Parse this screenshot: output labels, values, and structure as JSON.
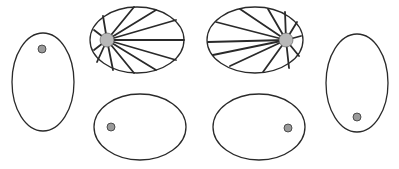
{
  "diagram": {
    "colors": {
      "stroke": "#2a2a2a",
      "hub": "#b8b8b8",
      "dot": "#9a9a9a",
      "background": "#ffffff"
    },
    "shapes": [
      {
        "id": "left-vertical-oval",
        "cx": 43,
        "cy": 82,
        "rx": 31,
        "ry": 49,
        "dot": {
          "cx": 42,
          "cy": 49,
          "r": 4
        }
      },
      {
        "id": "top-left-rayed-oval",
        "cx": 137,
        "cy": 40,
        "rx": 47,
        "ry": 33,
        "hub": {
          "cx": 107,
          "cy": 40,
          "r": 7
        },
        "ray_count": 12
      },
      {
        "id": "bottom-left-oval",
        "cx": 140,
        "cy": 127,
        "rx": 46,
        "ry": 33,
        "dot": {
          "cx": 111,
          "cy": 127,
          "r": 4
        }
      },
      {
        "id": "top-right-rayed-oval",
        "cx": 255,
        "cy": 40,
        "rx": 48,
        "ry": 33,
        "hub": {
          "cx": 286,
          "cy": 40,
          "r": 7
        },
        "ray_count": 12
      },
      {
        "id": "bottom-right-oval",
        "cx": 259,
        "cy": 127,
        "rx": 46,
        "ry": 33,
        "dot": {
          "cx": 288,
          "cy": 128,
          "r": 4
        }
      },
      {
        "id": "right-vertical-oval",
        "cx": 357,
        "cy": 83,
        "rx": 31,
        "ry": 49,
        "dot": {
          "cx": 357,
          "cy": 117,
          "r": 4
        }
      }
    ]
  }
}
